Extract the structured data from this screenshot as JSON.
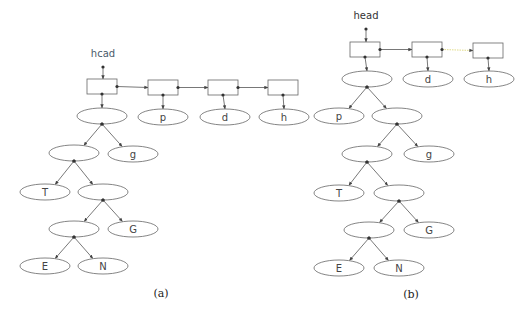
{
  "figure": {
    "panels": [
      {
        "id": "a",
        "caption": "(a)",
        "head_label": "hcad",
        "head_label_color": "#4a5a6a",
        "list": [
          {
            "id": "a-b1",
            "points_to": "a-root"
          },
          {
            "id": "a-b2",
            "points_to": "a-p"
          },
          {
            "id": "a-b3",
            "points_to": "a-d"
          },
          {
            "id": "a-b4",
            "points_to": "a-h"
          }
        ],
        "nodes": [
          {
            "id": "a-root",
            "label": ""
          },
          {
            "id": "a-p",
            "label": "p"
          },
          {
            "id": "a-d",
            "label": "d"
          },
          {
            "id": "a-h",
            "label": "h"
          },
          {
            "id": "a-n1",
            "label": ""
          },
          {
            "id": "a-g",
            "label": "g"
          },
          {
            "id": "a-T",
            "label": "T"
          },
          {
            "id": "a-n2",
            "label": ""
          },
          {
            "id": "a-n3",
            "label": ""
          },
          {
            "id": "a-G",
            "label": "G"
          },
          {
            "id": "a-E",
            "label": "E"
          },
          {
            "id": "a-N",
            "label": "N"
          }
        ],
        "tree_edges": [
          [
            "a-root",
            "a-n1"
          ],
          [
            "a-root",
            "a-g"
          ],
          [
            "a-n1",
            "a-T"
          ],
          [
            "a-n1",
            "a-n2"
          ],
          [
            "a-n2",
            "a-n3"
          ],
          [
            "a-n2",
            "a-G"
          ],
          [
            "a-n3",
            "a-E"
          ],
          [
            "a-n3",
            "a-N"
          ]
        ]
      },
      {
        "id": "b",
        "caption": "(b)",
        "head_label": "head",
        "head_label_color": "#333333",
        "list": [
          {
            "id": "b-b1",
            "points_to": "b-root"
          },
          {
            "id": "b-b2",
            "points_to": "b-d"
          },
          {
            "id": "b-b3",
            "points_to": "b-h"
          }
        ],
        "nodes": [
          {
            "id": "b-root",
            "label": ""
          },
          {
            "id": "b-d",
            "label": "d"
          },
          {
            "id": "b-h",
            "label": "h"
          },
          {
            "id": "b-p",
            "label": "p"
          },
          {
            "id": "b-n1",
            "label": ""
          },
          {
            "id": "b-n2",
            "label": ""
          },
          {
            "id": "b-g",
            "label": "g"
          },
          {
            "id": "b-T",
            "label": "T"
          },
          {
            "id": "b-n3",
            "label": ""
          },
          {
            "id": "b-n4",
            "label": ""
          },
          {
            "id": "b-G",
            "label": "G"
          },
          {
            "id": "b-E",
            "label": "E"
          },
          {
            "id": "b-N",
            "label": "N"
          }
        ],
        "tree_edges": [
          [
            "b-root",
            "b-p"
          ],
          [
            "b-root",
            "b-n1"
          ],
          [
            "b-n1",
            "b-n2"
          ],
          [
            "b-n1",
            "b-g"
          ],
          [
            "b-n2",
            "b-T"
          ],
          [
            "b-n2",
            "b-n3"
          ],
          [
            "b-n3",
            "b-n4"
          ],
          [
            "b-n3",
            "b-G"
          ],
          [
            "b-n4",
            "b-E"
          ],
          [
            "b-n4",
            "b-N"
          ]
        ]
      }
    ]
  }
}
